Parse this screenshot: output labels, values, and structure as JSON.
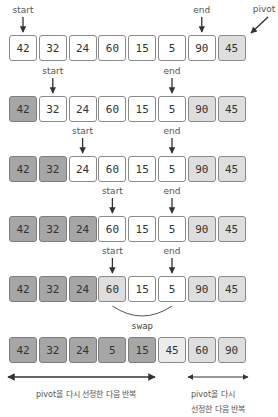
{
  "labels": {
    "start": "start",
    "end": "end",
    "pivot": "pivot",
    "swap": "swap",
    "left_note": "pivot을 다시 선정한 다음 반복",
    "right_note_line1": "pivot을 다시",
    "right_note_line2": "선정한 다음 반복"
  },
  "colors": {
    "white": "#ffffff",
    "light": "#dedede",
    "pale": "#ececec",
    "dark": "#a6a6a6"
  },
  "rows": [
    {
      "values": [
        "42",
        "32",
        "24",
        "60",
        "15",
        "5",
        "90",
        "45"
      ],
      "styles": [
        "white",
        "white",
        "white",
        "white",
        "white",
        "white",
        "white",
        "light"
      ],
      "start_index": 0,
      "end_index": 6,
      "pivot_index": 7
    },
    {
      "values": [
        "42",
        "32",
        "24",
        "60",
        "15",
        "5",
        "90",
        "45"
      ],
      "styles": [
        "dark",
        "white",
        "white",
        "white",
        "white",
        "white",
        "light",
        "light"
      ],
      "start_index": 1,
      "end_index": 5
    },
    {
      "values": [
        "42",
        "32",
        "24",
        "60",
        "15",
        "5",
        "90",
        "45"
      ],
      "styles": [
        "dark",
        "dark",
        "white",
        "white",
        "white",
        "white",
        "light",
        "light"
      ],
      "start_index": 2,
      "end_index": 5
    },
    {
      "values": [
        "42",
        "32",
        "24",
        "60",
        "15",
        "5",
        "90",
        "45"
      ],
      "styles": [
        "dark",
        "dark",
        "dark",
        "white",
        "white",
        "white",
        "light",
        "light"
      ],
      "start_index": 3,
      "end_index": 5
    },
    {
      "values": [
        "42",
        "32",
        "24",
        "60",
        "15",
        "5",
        "90",
        "45"
      ],
      "styles": [
        "dark",
        "dark",
        "dark",
        "light",
        "white",
        "white",
        "light",
        "light"
      ],
      "start_index": 3,
      "end_index": 5,
      "swap": [
        3,
        5
      ]
    },
    {
      "values": [
        "42",
        "32",
        "24",
        "5",
        "15",
        "45",
        "60",
        "90"
      ],
      "styles": [
        "dark",
        "dark",
        "dark",
        "dark",
        "dark",
        "pale",
        "light",
        "light"
      ]
    }
  ]
}
